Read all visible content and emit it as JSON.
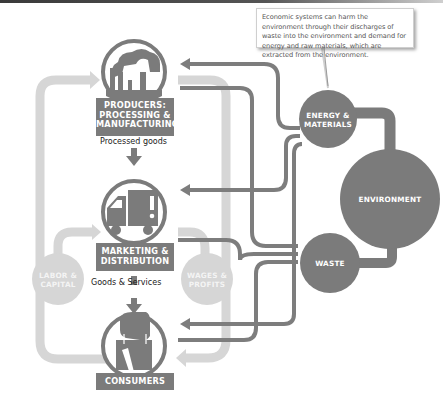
{
  "callout": {
    "text": "Economic systems can harm the environment through their discharges of waste into the environment and demand for energy and raw materials, which are extracted from the environment."
  },
  "nodes": {
    "producers": {
      "label_line1": "PRODUCERS:",
      "label_line2": "PROCESSING &",
      "label_line3": "MANUFACTURING",
      "icon": "factory-icon"
    },
    "marketing": {
      "label_line1": "MARKETING &",
      "label_line2": "DISTRIBUTION",
      "icon": "truck-icon"
    },
    "consumers": {
      "label_line1": "CONSUMERS",
      "icon": "shopping-bag-icon"
    },
    "labor": {
      "label_line1": "LABOR &",
      "label_line2": "CAPITAL"
    },
    "wages": {
      "label_line1": "WAGES &",
      "label_line2": "PROFITS"
    },
    "energy": {
      "label_line1": "ENERGY &",
      "label_line2": "MATERIALS"
    },
    "environment": {
      "label_line1": "ENVIRONMENT"
    },
    "waste": {
      "label_line1": "WASTE"
    }
  },
  "flows": {
    "processed_goods": "Processed goods",
    "goods_services": "Goods & Services"
  },
  "colors": {
    "dark": "#7b7b7b",
    "light": "#d3d3d3",
    "text": "#222222"
  }
}
